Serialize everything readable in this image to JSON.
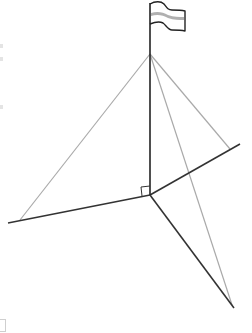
{
  "diagram": {
    "title": "",
    "colors": {
      "ground_line": "#333333",
      "pole": "#222222",
      "guy_wire": "#aaaaaa",
      "flag_outline": "#222222",
      "flag_stripe": "#b0b0b0"
    },
    "points": {
      "pole_top": [
        150,
        3
      ],
      "apex": [
        150,
        54
      ],
      "base": [
        150,
        195
      ],
      "left_end": [
        8,
        223
      ],
      "right_end": [
        240,
        144
      ],
      "down_end": [
        234,
        308
      ],
      "anchor_left": [
        20,
        220
      ],
      "anchor_right": [
        230,
        149
      ],
      "anchor_down": [
        232,
        305
      ]
    },
    "right_angle_marker": {
      "size": 9
    },
    "labels": []
  }
}
